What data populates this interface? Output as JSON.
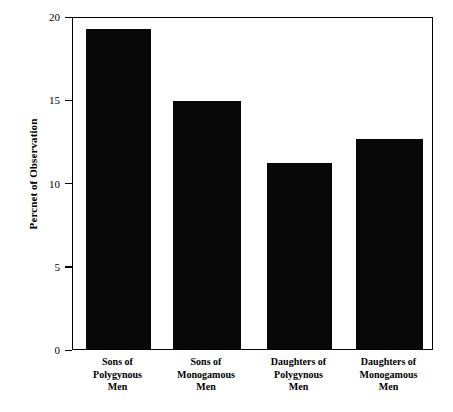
{
  "chart_data": {
    "type": "bar",
    "title": "",
    "xlabel": "",
    "ylabel": "Percnet of Observation",
    "categories": [
      "Sons of\nPolygynous\nMen",
      "Sons of\nMonogamous\nMen",
      "Daughters of\nPolygynous\nMen",
      "Daughters of\nMonogamous\nMen"
    ],
    "values": [
      19.2,
      14.9,
      11.2,
      12.6
    ],
    "ylim": [
      0,
      20
    ],
    "yticks": [
      0,
      5,
      10,
      15,
      20
    ],
    "ytick_labels": [
      "0",
      "5",
      "10",
      "15",
      "20"
    ],
    "grid": false,
    "legend": false,
    "bar_color": "#080808",
    "background_color": "#ffffff",
    "axis_color": "#000000"
  }
}
